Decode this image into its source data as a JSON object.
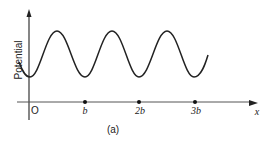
{
  "figure": {
    "caption": "(a)",
    "y_axis_label": "Potential",
    "x_axis_label": "x",
    "origin_label": "O",
    "ticks": [
      {
        "label": "b",
        "x": 85
      },
      {
        "label": "2b",
        "x": 139
      },
      {
        "label": "3b",
        "x": 195
      }
    ],
    "curve": {
      "description": "periodic potential, minima at lattice points 0, b, 2b, 3b",
      "color": "#222222"
    }
  }
}
